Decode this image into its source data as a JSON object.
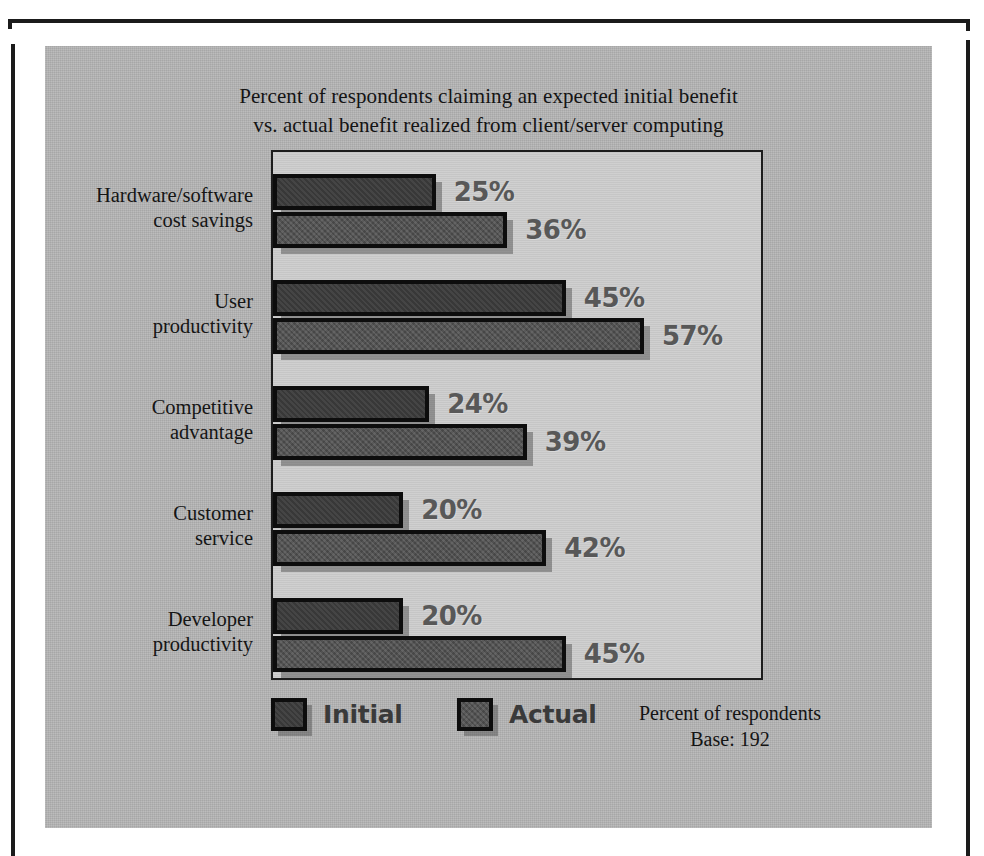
{
  "page": {
    "background_color": "#ffffff",
    "panel_color": "#b6b6b6",
    "rule_color": "#1b1b1b"
  },
  "legend": {
    "items": [
      {
        "label": "Initial",
        "color": "#3b3b3b"
      },
      {
        "label": "Actual",
        "color": "#4e4e4e"
      }
    ]
  },
  "footnote": {
    "line1": "Percent of respondents",
    "line2": "Base: 192"
  },
  "chart_data": {
    "type": "bar",
    "orientation": "horizontal",
    "title": "Percent of respondents claiming an expected initial benefit vs. actual benefit realized from client/server computing",
    "title_line1": "Percent of respondents claiming an expected initial benefit",
    "title_line2": "vs. actual benefit realized from client/server computing",
    "xlabel": "",
    "ylabel": "",
    "xlim": [
      0,
      75
    ],
    "grid": false,
    "legend_position": "bottom-left",
    "categories": [
      "Hardware/software cost savings",
      "User productivity",
      "Competitive advantage",
      "Customer service",
      "Developer productivity"
    ],
    "category_lines": [
      [
        "Hardware/software",
        "cost savings"
      ],
      [
        "User",
        "productivity"
      ],
      [
        "Competitive",
        "advantage"
      ],
      [
        "Customer",
        "service"
      ],
      [
        "Developer",
        "productivity"
      ]
    ],
    "series": [
      {
        "name": "Initial",
        "color": "#3b3b3b",
        "values": [
          25,
          45,
          24,
          20,
          20
        ],
        "labels": [
          "25%",
          "45%",
          "24%",
          "20%",
          "20%"
        ]
      },
      {
        "name": "Actual",
        "color": "#4e4e4e",
        "values": [
          36,
          57,
          39,
          42,
          45
        ],
        "labels": [
          "36%",
          "57%",
          "39%",
          "42%",
          "45%"
        ]
      }
    ]
  }
}
